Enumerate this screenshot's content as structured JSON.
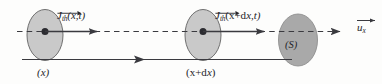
{
  "figure": {
    "type": "physics-diagram",
    "background_color": "#fdfdfc",
    "ink_color": "#25252a"
  },
  "axis": {
    "name": "x-axis",
    "style": "dashed",
    "unit_vector_label": {
      "symbol": "u",
      "subscript": "x",
      "vector_arrow": true
    }
  },
  "cross_sections": [
    {
      "id": "section-left",
      "position_label": "(x)",
      "fill_color": "#c8c8c8",
      "stroke_color": "#6e6e6e"
    },
    {
      "id": "section-middle",
      "position_label": "(x+dx)",
      "fill_color": "#c8c8c8",
      "stroke_color": "#6e6e6e"
    },
    {
      "id": "section-right",
      "position_label": "(S)",
      "fill_color": "#a8a8a8",
      "stroke_color": "#8a8a8a"
    }
  ],
  "vectors": [
    {
      "id": "current-density-at-x",
      "symbol": "J",
      "subscript": "th",
      "arguments": "(x,t)",
      "vector_arrow": true
    },
    {
      "id": "current-density-at-x-plus-dx",
      "symbol": "J",
      "subscript": "th",
      "arguments": "(x+dx,t)",
      "vector_arrow": true
    }
  ],
  "labels": {
    "j1_args": "(x,t)",
    "j2_args_open": "(x+d",
    "j2_args_close": ",t)",
    "j_symbol": "J",
    "j_subscript": "th",
    "u_symbol": "u",
    "u_subscript": "x",
    "x_var": "x",
    "section_s": "(S)",
    "pos_x": "(x)",
    "pos_x_plus_dx_open": "(x+d",
    "pos_x_plus_dx_close": ")"
  }
}
